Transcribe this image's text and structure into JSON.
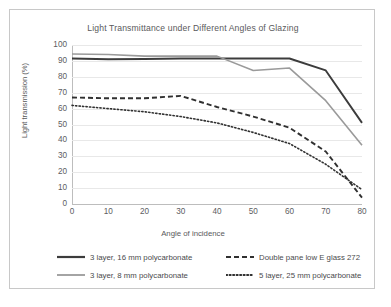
{
  "chart_data": {
    "type": "line",
    "title": "Light Transmittance under Different Angles of Glazing",
    "xlabel": "Angle of incidence",
    "ylabel": "Light transmission (%)",
    "xlim": [
      0,
      80
    ],
    "ylim": [
      0,
      100
    ],
    "xticks": [
      0,
      10,
      20,
      30,
      40,
      50,
      60,
      70,
      80
    ],
    "yticks": [
      0,
      10,
      20,
      30,
      40,
      50,
      60,
      70,
      80,
      90,
      100
    ],
    "grid": "horizontal",
    "legend_position": "bottom",
    "x": [
      0,
      10,
      20,
      30,
      40,
      50,
      60,
      70,
      80
    ],
    "series": [
      {
        "name": "3 layer, 16 mm polycarbonate",
        "style": "solid",
        "color": "#3c3c3c",
        "width": 1.9,
        "values": [
          91.5,
          91,
          91.2,
          91.5,
          91.5,
          91.5,
          91.5,
          84,
          51
        ]
      },
      {
        "name": "3 layer, 8 mm polycarbonate",
        "style": "solid",
        "color": "#9a9a9a",
        "width": 1.6,
        "values": [
          94.3,
          94,
          93,
          93,
          93,
          84,
          85.5,
          65,
          37
        ]
      },
      {
        "name": "Double pane low E glass 272",
        "style": "dashed",
        "color": "#303030",
        "width": 1.9,
        "values": [
          67,
          66.5,
          66.5,
          68,
          61,
          55,
          48,
          33,
          4
        ]
      },
      {
        "name": "5 layer, 25 mm polycarbonate",
        "style": "dotted",
        "color": "#303030",
        "width": 1.6,
        "values": [
          62,
          60,
          58,
          55,
          51,
          45,
          38,
          25,
          9
        ]
      }
    ]
  }
}
